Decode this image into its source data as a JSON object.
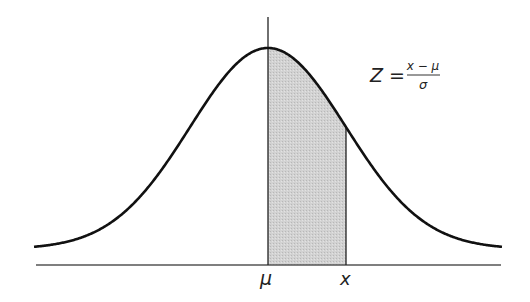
{
  "diagram": {
    "type": "normal-distribution",
    "labels": {
      "mean": "μ",
      "x": "x",
      "formula_lhs": "Z =",
      "formula_numerator": "x − μ",
      "formula_denominator": "σ"
    },
    "colors": {
      "curve": "#111111",
      "axis": "#444444",
      "shade": "#cccccc",
      "lines": "#222222"
    },
    "geometry": {
      "center_px": 268,
      "sigma_px": 78,
      "x_px": 346,
      "baseline_y": 265,
      "peak_y": 48,
      "tail_y": 249,
      "x_start": 34,
      "x_end": 502
    }
  }
}
